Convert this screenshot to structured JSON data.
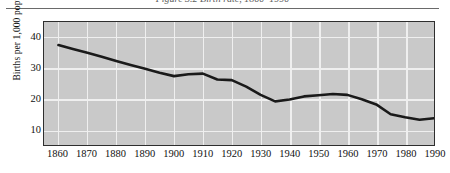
{
  "figure": {
    "title": "Figure 3.2 Birth rate, 1860–1990",
    "ylabel": "Births per 1,000 population"
  },
  "chart_data": {
    "type": "line",
    "title": "Figure 3.2 Birth rate, 1860–1990",
    "xlabel": "",
    "ylabel": "Births per 1,000 population",
    "xlim": [
      1855,
      1990
    ],
    "ylim": [
      5,
      45
    ],
    "yticks": [
      10,
      20,
      30,
      40
    ],
    "xticks": [
      1860,
      1870,
      1880,
      1890,
      1900,
      1910,
      1920,
      1930,
      1940,
      1950,
      1960,
      1970,
      1980,
      1990
    ],
    "grid": true,
    "legend": "none",
    "line_color": "#1a1a1a",
    "plot_background": "#c9c9c9",
    "gridline_color": "#efefef",
    "series": [
      {
        "name": "Births per 1,000 population",
        "x": [
          1860,
          1865,
          1870,
          1875,
          1880,
          1885,
          1890,
          1895,
          1900,
          1905,
          1910,
          1915,
          1920,
          1925,
          1930,
          1935,
          1940,
          1945,
          1950,
          1955,
          1960,
          1965,
          1970,
          1975,
          1980,
          1985,
          1990
        ],
        "values": [
          37.5,
          36.2,
          35.0,
          33.7,
          32.3,
          31.0,
          29.8,
          28.5,
          27.4,
          28.0,
          28.2,
          26.3,
          26.1,
          24.0,
          21.3,
          19.2,
          19.8,
          20.8,
          21.2,
          21.6,
          21.3,
          19.9,
          18.2,
          15.0,
          14.0,
          13.2,
          13.7
        ]
      }
    ],
    "annotations": []
  }
}
